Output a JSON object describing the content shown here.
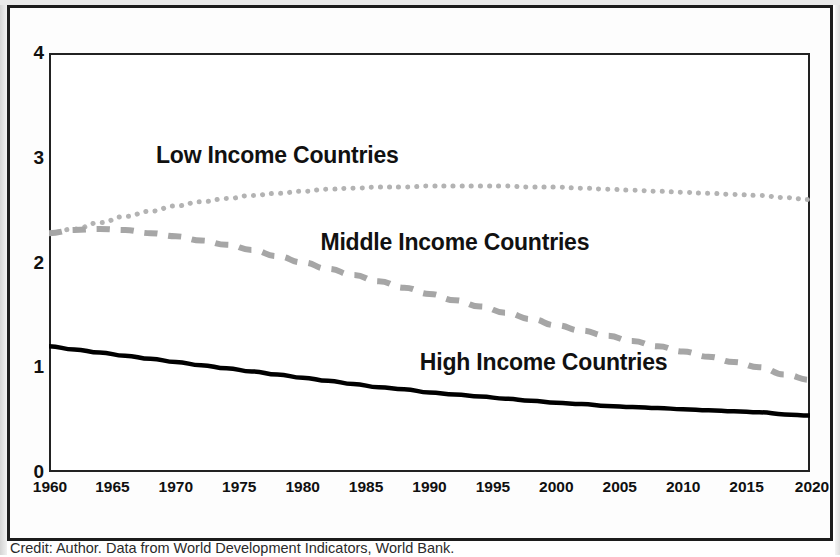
{
  "caption": "Credit: Author. Data from World Development Indicators, World Bank.",
  "colors": {
    "low_income": "#b3b3b3",
    "middle_income": "#a6a6a6",
    "high_income": "#000000",
    "axis": "#222222",
    "frame": "#1c1c1c",
    "text": "#101010"
  },
  "chart_data": {
    "type": "line",
    "title": "",
    "subtitle": "",
    "xlabel": "",
    "ylabel": "",
    "xlim": [
      1960,
      2020
    ],
    "ylim": [
      0,
      4
    ],
    "grid": false,
    "legend_position": "inline-labels",
    "x_ticks": [
      1960,
      1965,
      1970,
      1975,
      1980,
      1985,
      1990,
      1995,
      2000,
      2005,
      2010,
      2015,
      2020
    ],
    "y_ticks": [
      0,
      1,
      2,
      3,
      4
    ],
    "annotations": [
      {
        "text": "Low Income Countries",
        "x": 1978,
        "y": 2.98
      },
      {
        "text": "Middle Income Countries",
        "x": 1992,
        "y": 2.15
      },
      {
        "text": "High Income Countries",
        "x": 1999,
        "y": 1.0
      }
    ],
    "x": [
      1960,
      1962,
      1964,
      1966,
      1968,
      1970,
      1972,
      1974,
      1976,
      1978,
      1980,
      1982,
      1984,
      1986,
      1988,
      1990,
      1992,
      1994,
      1996,
      1998,
      2000,
      2002,
      2004,
      2006,
      2008,
      2010,
      2012,
      2014,
      2016,
      2018,
      2020
    ],
    "series": [
      {
        "name": "Low Income Countries",
        "style": "dotted",
        "color": "#b3b3b3",
        "values": [
          2.28,
          2.32,
          2.38,
          2.44,
          2.49,
          2.54,
          2.58,
          2.61,
          2.64,
          2.66,
          2.68,
          2.7,
          2.71,
          2.72,
          2.72,
          2.73,
          2.73,
          2.73,
          2.73,
          2.72,
          2.72,
          2.71,
          2.7,
          2.69,
          2.68,
          2.67,
          2.66,
          2.65,
          2.64,
          2.62,
          2.6
        ]
      },
      {
        "name": "Middle Income Countries",
        "style": "dashed",
        "color": "#a6a6a6",
        "values": [
          2.28,
          2.31,
          2.32,
          2.31,
          2.28,
          2.25,
          2.21,
          2.17,
          2.12,
          2.06,
          2.0,
          1.94,
          1.88,
          1.82,
          1.76,
          1.7,
          1.64,
          1.58,
          1.52,
          1.46,
          1.4,
          1.35,
          1.3,
          1.25,
          1.2,
          1.15,
          1.1,
          1.05,
          1.0,
          0.93,
          0.88
        ]
      },
      {
        "name": "High Income Countries",
        "style": "solid",
        "color": "#000000",
        "values": [
          1.2,
          1.17,
          1.14,
          1.11,
          1.08,
          1.05,
          1.02,
          0.99,
          0.96,
          0.93,
          0.9,
          0.87,
          0.84,
          0.81,
          0.79,
          0.76,
          0.74,
          0.72,
          0.7,
          0.68,
          0.66,
          0.65,
          0.63,
          0.62,
          0.61,
          0.6,
          0.59,
          0.58,
          0.57,
          0.55,
          0.54
        ]
      }
    ]
  }
}
